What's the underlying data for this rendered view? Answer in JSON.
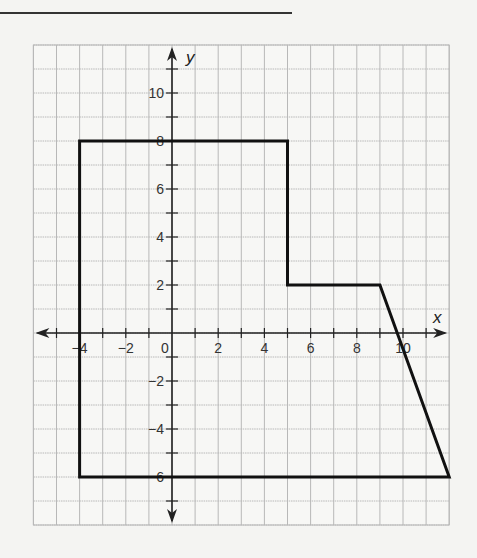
{
  "chart_data": {
    "type": "polygon_on_grid",
    "title": "",
    "xlabel": "x",
    "ylabel": "y",
    "xlim": [
      -6,
      12
    ],
    "ylim": [
      -8,
      12
    ],
    "grid": true,
    "x_tick_labels": [
      "-4",
      "-2",
      "0",
      "2",
      "4",
      "6",
      "8",
      "10"
    ],
    "y_tick_labels": [
      "10",
      "8",
      "6",
      "4",
      "2",
      "-2",
      "-4",
      "-6"
    ],
    "polygon": {
      "vertices": [
        [
          -4,
          8
        ],
        [
          5,
          8
        ],
        [
          5,
          2
        ],
        [
          9,
          2
        ],
        [
          12,
          -6
        ],
        [
          -4,
          -6
        ]
      ],
      "stroke": "#111111"
    }
  },
  "colors": {
    "background": "#f4f4f2",
    "grid": "#b8b8b8",
    "axis": "#222222",
    "shape": "#111111"
  }
}
